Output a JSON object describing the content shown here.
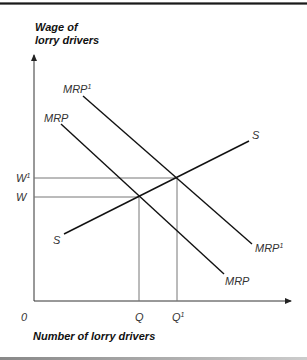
{
  "diagram": {
    "y_axis_title_line1": "Wage of",
    "y_axis_title_line2": "lorry drivers",
    "x_axis_title": "Number of lorry drivers",
    "origin_label": "0",
    "y_ticks": [
      {
        "label": "W",
        "sup": "1"
      },
      {
        "label": "W",
        "sup": ""
      }
    ],
    "x_ticks": [
      {
        "label": "Q",
        "sup": ""
      },
      {
        "label": "Q",
        "sup": "1"
      }
    ],
    "curves": {
      "mrp1": {
        "label": "MRP",
        "sup": "1"
      },
      "mrp": {
        "label": "MRP",
        "sup": ""
      },
      "supply": {
        "label": "S"
      }
    },
    "colors": {
      "curve": "#111111",
      "axis": "#333333",
      "guide": "#777777"
    }
  }
}
